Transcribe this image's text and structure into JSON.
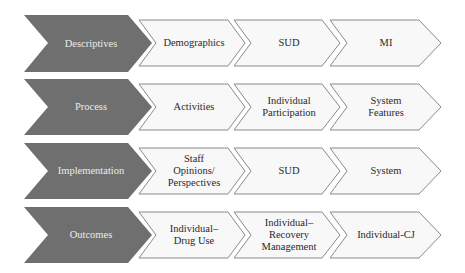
{
  "colors": {
    "head_fill": "#6f6f6f",
    "head_text": "#ececec",
    "step_fill": "#f8f8f8",
    "step_stroke": "#8a8a8a",
    "step_text": "#2a2a2a"
  },
  "rows": [
    {
      "head": "Descriptives",
      "steps": [
        "Demographics",
        "SUD",
        "MI"
      ]
    },
    {
      "head": "Process",
      "steps": [
        "Activities",
        "Individual\nParticipation",
        "System\nFeatures"
      ]
    },
    {
      "head": "Implementation",
      "steps": [
        "Staff\nOpinions/\nPerspectives",
        "SUD",
        "System"
      ]
    },
    {
      "head": "Outcomes",
      "steps": [
        "Individual–\nDrug Use",
        "Individual–\nRecovery\nManagement",
        "Individual-CJ"
      ]
    }
  ]
}
